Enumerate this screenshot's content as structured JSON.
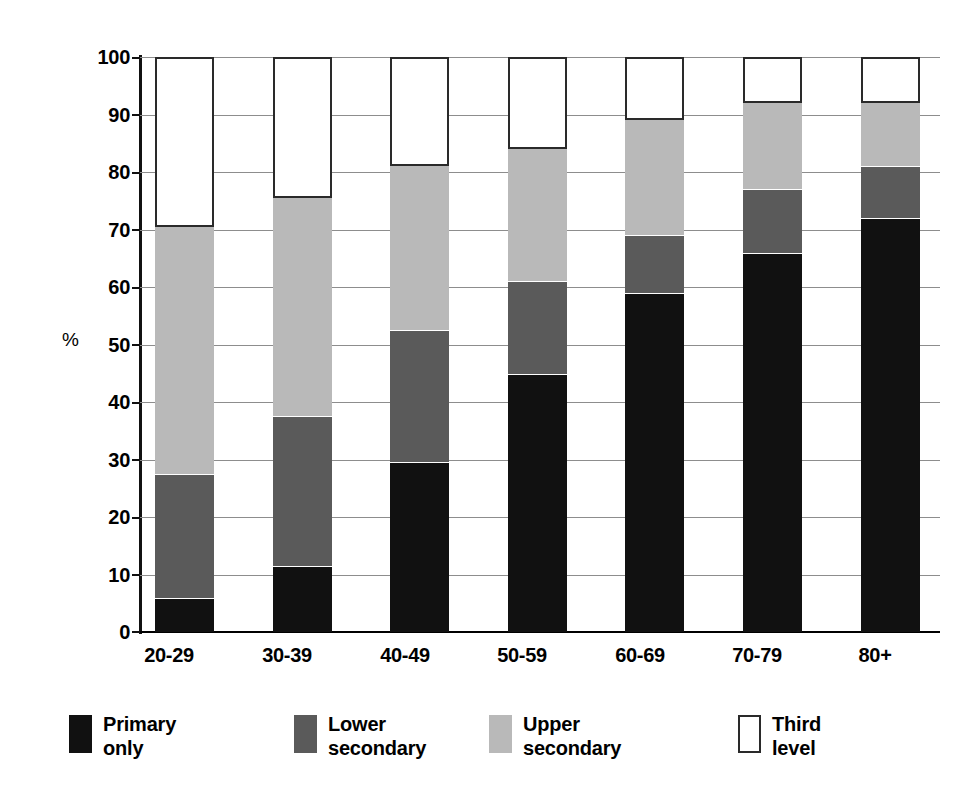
{
  "chart_data": {
    "type": "bar",
    "subtype": "stacked-bar-100-percent",
    "title": "",
    "subtitle": "",
    "xlabel": "",
    "ylabel": "%",
    "ylim": [
      0,
      100
    ],
    "yticks": [
      0,
      10,
      20,
      30,
      40,
      50,
      60,
      70,
      80,
      90,
      100
    ],
    "ytick_labels": [
      "0",
      "10",
      "20",
      "30",
      "40",
      "50",
      "60",
      "70",
      "80",
      "90",
      "100"
    ],
    "grid": true,
    "grid_axis": "y",
    "legend_position": "bottom",
    "categories": [
      "20-29",
      "30-39",
      "40-49",
      "50-59",
      "60-69",
      "70-79",
      "80+"
    ],
    "series": [
      {
        "name": "Primary only",
        "legend_label": "Primary\nonly",
        "color": "#111111",
        "values": [
          6,
          11.5,
          29.5,
          44.8,
          59,
          66,
          72
        ]
      },
      {
        "name": "Lower secondary",
        "legend_label": "Lower\nsecondary",
        "color": "#5a5a5a",
        "values": [
          21.5,
          26,
          23,
          16.2,
          10,
          11,
          9
        ]
      },
      {
        "name": "Upper secondary",
        "legend_label": "Upper\nsecondary",
        "color": "#b9b9b9",
        "values": [
          43,
          38,
          28.5,
          23,
          20,
          15,
          11
        ]
      },
      {
        "name": "Third level",
        "legend_label": "Third\nlevel",
        "color": "#ffffff",
        "values": [
          29.5,
          24.5,
          19,
          16,
          11,
          8,
          8
        ]
      }
    ],
    "cumulative_tops": {
      "20-29": {
        "primary_only": 6,
        "lower_secondary": 27.5,
        "upper_secondary": 70.5,
        "third_level": 100
      },
      "30-39": {
        "primary_only": 11.5,
        "lower_secondary": 37.5,
        "upper_secondary": 75.5,
        "third_level": 100
      },
      "40-49": {
        "primary_only": 29.5,
        "lower_secondary": 52.5,
        "upper_secondary": 81,
        "third_level": 100
      },
      "50-59": {
        "primary_only": 44.8,
        "lower_secondary": 61,
        "upper_secondary": 84,
        "third_level": 100
      },
      "60-69": {
        "primary_only": 59,
        "lower_secondary": 69,
        "upper_secondary": 89,
        "third_level": 100
      },
      "70-79": {
        "primary_only": 66,
        "lower_secondary": 77,
        "upper_secondary": 92,
        "third_level": 100
      },
      "80+": {
        "primary_only": 72,
        "lower_secondary": 81,
        "upper_secondary": 92,
        "third_level": 100
      }
    }
  },
  "axis": {
    "unit_label": "%",
    "ytick_labels": [
      "100",
      "90",
      "80",
      "70",
      "60",
      "50",
      "40",
      "30",
      "20",
      "10",
      "0"
    ],
    "xtick_labels": [
      "20-29",
      "30-39",
      "40-49",
      "50-59",
      "60-69",
      "70-79",
      "80+"
    ]
  },
  "legend": {
    "items": [
      {
        "label": "Primary\nonly",
        "color": "#111111",
        "swatch": "sw-primary"
      },
      {
        "label": "Lower\nsecondary",
        "color": "#5a5a5a",
        "swatch": "sw-lower"
      },
      {
        "label": "Upper\nsecondary",
        "color": "#b9b9b9",
        "swatch": "sw-upper"
      },
      {
        "label": "Third\nlevel",
        "color": "#ffffff",
        "swatch": "sw-third"
      }
    ]
  },
  "colors": {
    "primary_only": "#111111",
    "lower_secondary": "#5a5a5a",
    "upper_secondary": "#b9b9b9",
    "third_level": "#ffffff",
    "gridline": "#8d8d8d",
    "axis": "#111111",
    "background": "#ffffff"
  }
}
